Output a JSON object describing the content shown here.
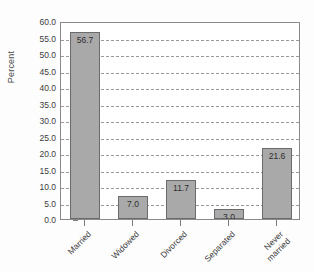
{
  "chart_data": {
    "type": "bar",
    "title": "",
    "subtitle": "",
    "xlabel": "",
    "ylabel": "Percent",
    "categories": [
      "Married",
      "Widowed",
      "Divorced",
      "Separated",
      "Never married"
    ],
    "values": [
      56.7,
      11.7,
      11.7,
      3.0,
      21.6
    ],
    "series": [
      {
        "name": "Percent",
        "values": [
          56.7,
          7.0,
          11.7,
          3.0,
          21.6
        ]
      }
    ],
    "data_labels": [
      "56.7",
      "7.0",
      "11.7",
      "3.0",
      "21.6"
    ],
    "ylim": [
      0.0,
      60.0
    ],
    "ytick_values": [
      0.0,
      5.0,
      10.0,
      15.0,
      20.0,
      25.0,
      30.0,
      35.0,
      40.0,
      45.0,
      50.0,
      55.0,
      60.0
    ],
    "ytick_labels": [
      "0.0",
      "5.0",
      "10.0",
      "15.0",
      "20.0",
      "25.0",
      "30.0",
      "35.0",
      "40.0",
      "45.0",
      "50.0",
      "55.0",
      "60.0"
    ],
    "xtick_labels": [
      {
        "lines": [
          "Married"
        ]
      },
      {
        "lines": [
          "Widowed"
        ]
      },
      {
        "lines": [
          "Divorced"
        ]
      },
      {
        "lines": [
          "Separated"
        ]
      },
      {
        "lines": [
          "Never",
          "married"
        ]
      }
    ],
    "grid": true,
    "grid_axis": "y",
    "grid_style": "dashed",
    "legend": false,
    "legend_position": "none",
    "bar_color": "#a9a9a9",
    "bar_edge_color": "#6b6b6b",
    "grid_color": "#9a9a9a",
    "axis_color": "#8a8a8a",
    "background_color": "#ffffff",
    "xtick_label_rotation": -45
  }
}
